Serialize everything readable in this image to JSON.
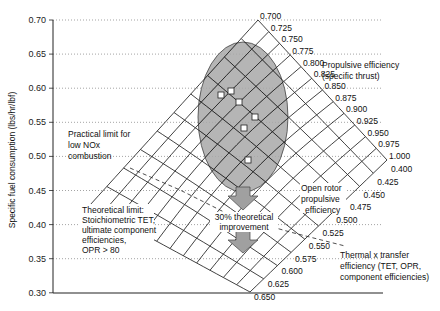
{
  "chart_data": {
    "type": "diagram-surface",
    "title": "",
    "ylabel": "Specific fuel consumption (lbs/hr/lbf)",
    "xlabel": "",
    "ylim": [
      0.3,
      0.7
    ],
    "y_ticks": [
      "0.70",
      "0.65",
      "0.60",
      "0.55",
      "0.50",
      "0.45",
      "0.40",
      "0.35",
      "0.30"
    ],
    "grid": "horizontal dotted",
    "propulsive_efficiency_labels": [
      "0.700",
      "0.725",
      "0.750",
      "0.775",
      "0.800",
      "0.825",
      "0.850",
      "0.875",
      "0.900",
      "0.925",
      "0.950",
      "0.975",
      "1.000"
    ],
    "thermal_transfer_efficiency_labels": [
      "0.400",
      "0.425",
      "0.450",
      "0.475",
      "0.500",
      "0.525",
      "0.550",
      "0.575",
      "0.600",
      "0.625",
      "0.650"
    ],
    "current_engines_points_sfc": [
      0.593,
      0.597,
      0.583,
      0.565,
      0.548,
      0.498
    ],
    "annotations": {
      "propulsive": "Propulsive efficiency\n(specific thrust)",
      "practical_limit": "Practical limit for\nlow NOx\ncombustion",
      "open_rotor": "Open rotor\npropulsive\nefficiency",
      "improvement": "30% theoretical\nimprovement",
      "theoretical_limit": "Theoretical limit:\nStoichiometric TET,\nultimate component\nefficiencies,\nOPR > 80",
      "thermal": "Thermal x transfer\nefficiency (TET, OPR,\ncomponent efficiencies)"
    }
  },
  "axis": {
    "ylabel": "Specific fuel consumption (lbs/hr/lbf)",
    "ticks": [
      "0.70",
      "0.65",
      "0.60",
      "0.55",
      "0.50",
      "0.45",
      "0.40",
      "0.35",
      "0.30"
    ]
  },
  "labels": {
    "propulsive_line1": "Propulsive efficiency",
    "propulsive_line2": "(specific thrust)",
    "practical_line1": "Practical limit for",
    "practical_line2": "low NOx",
    "practical_line3": "combustion",
    "open_rotor_line1": "Open rotor",
    "open_rotor_line2": "propulsive",
    "open_rotor_line3": "efficiency",
    "improvement_line1": "30% theoretical",
    "improvement_line2": "improvement",
    "theo_line1": "Theoretical limit:",
    "theo_line2": "Stoichiometric TET,",
    "theo_line3": "ultimate component",
    "theo_line4": "efficiencies,",
    "theo_line5": "OPR > 80",
    "thermal_line1": "Thermal x transfer",
    "thermal_line2": "efficiency (TET, OPR,",
    "thermal_line3": "component efficiencies)"
  },
  "prop_labels": [
    "0.700",
    "0.725",
    "0.750",
    "0.775",
    "0.800",
    "0.825",
    "0.850",
    "0.875",
    "0.900",
    "0.925",
    "0.950",
    "0.975",
    "1.000"
  ],
  "therm_labels": [
    "0.400",
    "0.425",
    "0.450",
    "0.475",
    "0.500",
    "0.525",
    "0.550",
    "0.575",
    "0.600",
    "0.625",
    "0.650"
  ],
  "colors": {
    "ellipse": "#a8a8a8",
    "arrow": "#a0a0a0",
    "grid": "#555555",
    "mesh": "#111111"
  }
}
